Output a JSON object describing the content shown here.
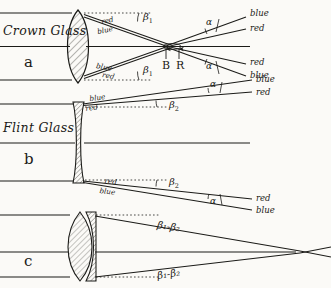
{
  "figure": {
    "ink_color": "#1b1b18",
    "paper_color": "#fbfaf7"
  },
  "panels": [
    {
      "id": "a",
      "letter": "a",
      "material": "Crown Glass",
      "lens": "biconvex",
      "angle_label": "β",
      "angle_sub": "1",
      "focus_points": [
        {
          "label": "B",
          "meaning": "blue-focus"
        },
        {
          "label": "R",
          "meaning": "red-focus"
        }
      ],
      "incident_labels_upper": [
        "red",
        "blue"
      ],
      "incident_labels_lower": [
        "blue",
        "red"
      ],
      "exit_labels_upper": [
        "blue",
        "red"
      ],
      "exit_labels_lower": [
        "red",
        "blue"
      ],
      "spread_angle": "α"
    },
    {
      "id": "b",
      "letter": "b",
      "material": "Flint Glass",
      "lens": "biconcave",
      "angle_label": "β",
      "angle_sub": "2",
      "incident_labels_upper": [
        "blue",
        "red"
      ],
      "incident_labels_lower": [
        "red",
        "blue"
      ],
      "exit_labels_upper": [
        "blue",
        "red"
      ],
      "exit_labels_lower": [
        "red",
        "blue"
      ],
      "spread_angle": "α"
    },
    {
      "id": "c",
      "letter": "c",
      "material": "",
      "lens": "achromatic-doublet",
      "angle_label_upper": "β₁-β₂",
      "angle_label_lower": "β₁-β₂",
      "spread_angle": ""
    }
  ],
  "labels": {
    "crown_glass": "Crown Glass",
    "flint_glass": "Flint Glass",
    "letter_a": "a",
    "letter_b": "b",
    "letter_c": "c",
    "blue": "blue",
    "red": "red",
    "B": "B",
    "R": "R",
    "alpha": "α",
    "beta": "β",
    "beta1": "β",
    "beta2": "β",
    "sub1": "1",
    "sub2": "2",
    "beta_diff": "β₁-β₂"
  }
}
